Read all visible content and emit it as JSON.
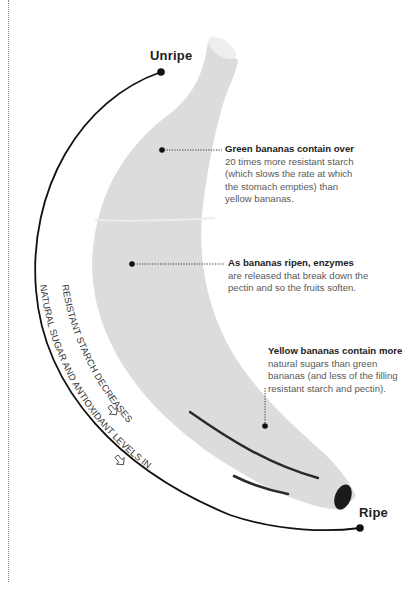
{
  "diagram": {
    "stages": {
      "start_label": "Unripe",
      "end_label": "Ripe"
    },
    "arc_captions": {
      "inner": "RESISTANT STARCH DECREASES",
      "outer": "NATURAL SUGAR AND ANTIOXIDANT LEVELS INCREASE",
      "arrow_icon": "hand-drawn-arrow-icon"
    },
    "annotations": [
      {
        "lead": "Green bananas contain over",
        "body_lines": [
          "20 times more resistant starch",
          "(which slows the rate at which",
          "the stomach empties) than",
          "yellow bananas."
        ]
      },
      {
        "lead": "As bananas ripen, enzymes",
        "body_lines": [
          "are released that break down the",
          "pectin and so the fruits soften."
        ]
      },
      {
        "lead": "Yellow bananas contain more",
        "body_lines": [
          "natural sugars than green",
          "bananas (and less of the filling",
          "resistant starch and pectin)."
        ]
      }
    ],
    "colors": {
      "banana_fill": "#dcdcdc",
      "banana_highlight": "#e6e6e6",
      "stem_cap": "#eeeeee",
      "tip": "#1a1a1a",
      "line": "#111111",
      "text_dark": "#222222",
      "text_body": "#5a5a5a"
    }
  }
}
